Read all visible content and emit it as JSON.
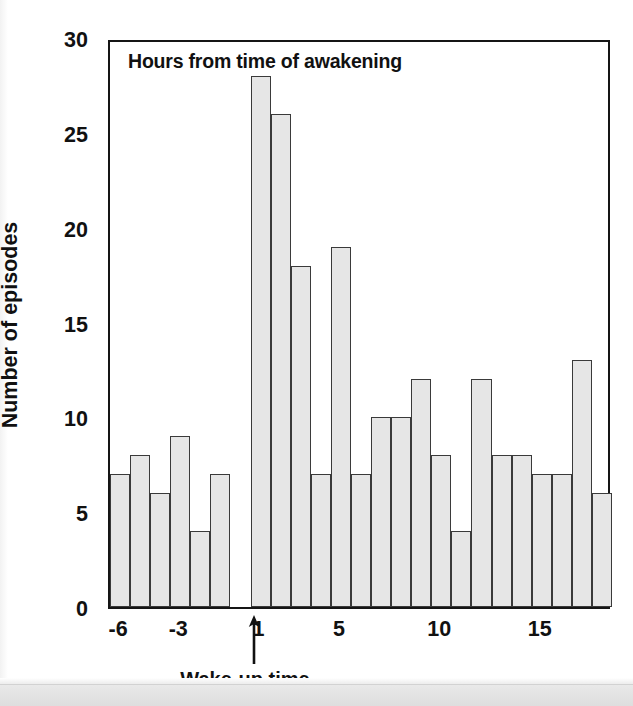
{
  "chart_data": {
    "type": "bar",
    "title": "Hours from time of awakening",
    "xlabel": "Wake-up time",
    "ylabel": "Number of episodes",
    "grid": false,
    "legend": null,
    "xlim": [
      -7,
      18
    ],
    "ylim": [
      0,
      30
    ],
    "bin_width": 1,
    "x_tick_labels": [
      "-6",
      "-3",
      "1",
      "5",
      "10",
      "15"
    ],
    "x_tick_values": [
      -6,
      -3,
      1,
      5,
      10,
      15
    ],
    "y_tick_labels": [
      "0",
      "5",
      "10",
      "15",
      "20",
      "25",
      "30"
    ],
    "y_tick_values": [
      0,
      5,
      10,
      15,
      20,
      25,
      30
    ],
    "bin_left_edges": [
      -7,
      -6,
      -5,
      -4,
      -3,
      -2,
      -1,
      0,
      1,
      2,
      3,
      4,
      5,
      6,
      7,
      8,
      9,
      10,
      11,
      12,
      13,
      14,
      15,
      16,
      17
    ],
    "categories": [
      "-7",
      "-6",
      "-5",
      "-4",
      "-3",
      "-2",
      "-1",
      "0",
      "1",
      "2",
      "3",
      "4",
      "5",
      "6",
      "7",
      "8",
      "9",
      "10",
      "11",
      "12",
      "13",
      "14",
      "15",
      "16",
      "17"
    ],
    "values": [
      7,
      8,
      6,
      9,
      4,
      7,
      0,
      28,
      26,
      18,
      7,
      19,
      7,
      10,
      10,
      12,
      8,
      4,
      12,
      8,
      8,
      7,
      7,
      13,
      6
    ],
    "annotations": [
      {
        "text": "Wake-up time",
        "type": "arrow-up",
        "x": 0
      }
    ],
    "bar_fill_color": "#e6e6e6",
    "bar_edge_color": "#3a3a3a",
    "axis_color": "#151515"
  }
}
